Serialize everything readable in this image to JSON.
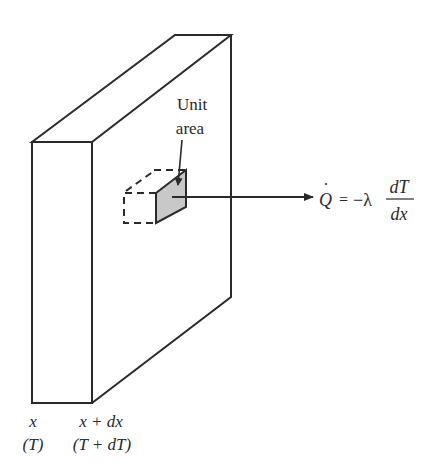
{
  "diagram": {
    "type": "heat-conduction-slab",
    "colors": {
      "line": "#2a2a2a",
      "unit_area_fill": "#c8c8c8",
      "background": "#ffffff"
    },
    "unit_area_label": {
      "line1": "Unit",
      "line2": "area"
    },
    "equation": {
      "lhs": "Q",
      "lhs_accent": "·",
      "equals": "=",
      "coefficient": "−λ",
      "numerator": "dT",
      "denominator": "dx"
    },
    "position_labels": [
      {
        "position": "x",
        "temperature": "(T)"
      },
      {
        "position": "x + dx",
        "temperature": "(T + dT)"
      }
    ]
  }
}
